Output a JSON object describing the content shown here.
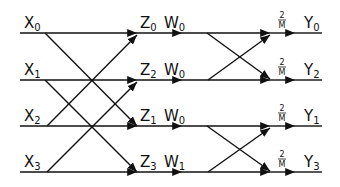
{
  "diagram": {
    "type": "butterfly-flow-graph",
    "inputs": [
      {
        "base": "X",
        "sub": "0"
      },
      {
        "base": "X",
        "sub": "1"
      },
      {
        "base": "X",
        "sub": "2"
      },
      {
        "base": "X",
        "sub": "3"
      }
    ],
    "intermediate": [
      {
        "base": "Z",
        "sub": "0"
      },
      {
        "base": "Z",
        "sub": "2"
      },
      {
        "base": "Z",
        "sub": "1"
      },
      {
        "base": "Z",
        "sub": "3"
      }
    ],
    "twiddles": [
      {
        "base": "W",
        "sub": "0"
      },
      {
        "base": "W",
        "sub": "0"
      },
      {
        "base": "W",
        "sub": "0"
      },
      {
        "base": "W",
        "sub": "1"
      }
    ],
    "scale": {
      "num": "2",
      "den": "M"
    },
    "outputs": [
      {
        "base": "Y",
        "sub": "0"
      },
      {
        "base": "Y",
        "sub": "2"
      },
      {
        "base": "Y",
        "sub": "1"
      },
      {
        "base": "Y",
        "sub": "3"
      }
    ]
  }
}
